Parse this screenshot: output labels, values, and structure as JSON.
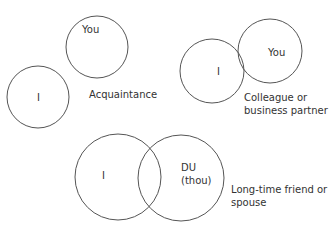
{
  "diagrams": [
    {
      "id": "acquaintance",
      "caption": "Acquaintance",
      "circles": [
        {
          "label": "I",
          "cx": 38,
          "cy": 97,
          "r": 31
        },
        {
          "label": "You",
          "cx": 97,
          "cy": 47,
          "r": 31
        }
      ]
    },
    {
      "id": "colleague",
      "caption_lines": [
        "Colleague or",
        "business partner"
      ],
      "circles": [
        {
          "label": "I",
          "cx": 212,
          "cy": 71,
          "r": 32
        },
        {
          "label": "You",
          "cx": 270,
          "cy": 51,
          "r": 32
        }
      ]
    },
    {
      "id": "friend",
      "caption_lines": [
        "Long-time friend or",
        "spouse"
      ],
      "circles": [
        {
          "label": "I",
          "cx": 118,
          "cy": 177,
          "r": 43
        },
        {
          "label_lines": [
            "DU",
            "(thou)"
          ],
          "cx": 181,
          "cy": 178,
          "r": 43
        }
      ]
    }
  ],
  "colors": {
    "stroke": "#555555",
    "text": "#333333",
    "background": "#ffffff"
  }
}
